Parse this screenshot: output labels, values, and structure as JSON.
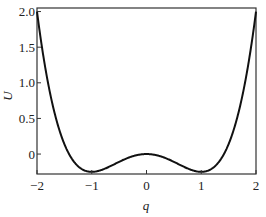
{
  "chart_data": {
    "type": "line",
    "title": "",
    "xlabel": "q",
    "ylabel": "U",
    "xlim": [
      -2,
      2
    ],
    "ylim": [
      -0.28,
      2.05
    ],
    "xticks": [
      -2,
      -1,
      0,
      1,
      2
    ],
    "xtick_labels": [
      "−2",
      "−1",
      "0",
      "1",
      "2"
    ],
    "yticks": [
      0,
      0.5,
      1.0,
      1.5,
      2.0
    ],
    "ytick_labels": [
      "0",
      "0.5",
      "1.0",
      "1.5",
      "2.0"
    ],
    "grid": false,
    "legend": null,
    "function": "U = q^4/4 - q^2/2",
    "series": [
      {
        "name": "U(q)",
        "color": "#111111",
        "x": [
          -2,
          -1.75,
          -1.5,
          -1.25,
          -1,
          -0.75,
          -0.5,
          -0.25,
          0,
          0.25,
          0.5,
          0.75,
          1,
          1.25,
          1.5,
          1.75,
          2
        ],
        "y": [
          2.0,
          0.814,
          0.141,
          -0.171,
          -0.25,
          -0.202,
          -0.109,
          -0.03,
          0,
          -0.03,
          -0.109,
          -0.202,
          -0.25,
          -0.171,
          0.141,
          0.814,
          2.0
        ]
      }
    ]
  }
}
